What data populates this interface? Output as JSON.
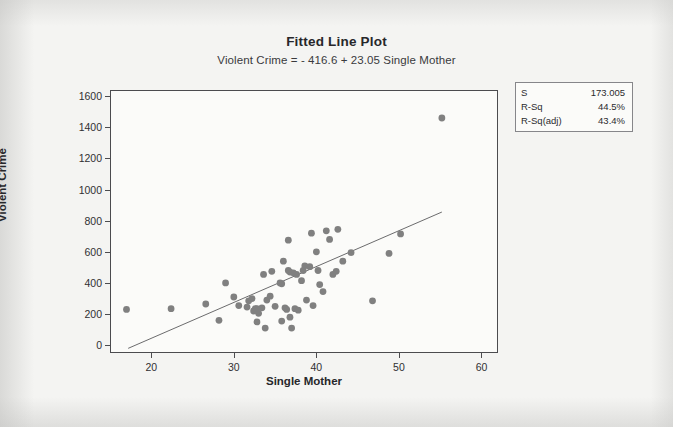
{
  "figure": {
    "background_color": "#f4f4f2",
    "plot_bg_color": "#fbfbf9",
    "axis_color": "#4c4c4f",
    "point_color": "#808080",
    "line_color": "#5a5a5c"
  },
  "stats_box": {
    "name": "regression-stats",
    "rows": [
      {
        "label": "S",
        "value": "173.005"
      },
      {
        "label": "R-Sq",
        "value": "44.5%"
      },
      {
        "label": "R-Sq(adj)",
        "value": "43.4%"
      }
    ]
  },
  "chart_data": {
    "type": "scatter",
    "title": "Fitted Line Plot",
    "subtitle": "Violent Crime =  - 416.6 + 23.05 Single Mother",
    "xlabel": "Single Mother",
    "ylabel": "Violent Crime",
    "xlim": [
      15.0,
      62.0
    ],
    "ylim": [
      -50,
      1640
    ],
    "xticks": [
      20,
      30,
      40,
      50,
      60
    ],
    "yticks": [
      0,
      200,
      400,
      600,
      800,
      1000,
      1200,
      1400,
      1600
    ],
    "grid": false,
    "legend": null,
    "regression": {
      "intercept": -416.6,
      "slope": 23.05,
      "equation": "Violent Crime =  - 416.6 + 23.05 Single Mother",
      "s": 173.005,
      "r_sq": 44.5,
      "r_sq_adj": 43.4,
      "x_start": 17.2,
      "x_end": 55.2
    },
    "series": [
      {
        "name": "Violent Crime vs Single Mother",
        "marker": "filled-circle",
        "points": [
          [
            17.0,
            230
          ],
          [
            22.4,
            235
          ],
          [
            26.6,
            265
          ],
          [
            28.2,
            160
          ],
          [
            29.0,
            400
          ],
          [
            30.0,
            310
          ],
          [
            30.6,
            255
          ],
          [
            31.6,
            245
          ],
          [
            31.8,
            285
          ],
          [
            32.2,
            300
          ],
          [
            32.4,
            220
          ],
          [
            32.6,
            235
          ],
          [
            32.8,
            235
          ],
          [
            32.8,
            150
          ],
          [
            33.0,
            205
          ],
          [
            33.4,
            240
          ],
          [
            33.6,
            455
          ],
          [
            33.8,
            110
          ],
          [
            34.0,
            290
          ],
          [
            34.4,
            315
          ],
          [
            34.6,
            475
          ],
          [
            35.0,
            250
          ],
          [
            35.6,
            400
          ],
          [
            35.8,
            395
          ],
          [
            35.8,
            155
          ],
          [
            36.0,
            540
          ],
          [
            36.2,
            240
          ],
          [
            36.4,
            230
          ],
          [
            36.6,
            675
          ],
          [
            36.6,
            480
          ],
          [
            36.8,
            180
          ],
          [
            36.8,
            470
          ],
          [
            37.0,
            110
          ],
          [
            37.2,
            465
          ],
          [
            37.4,
            235
          ],
          [
            37.6,
            455
          ],
          [
            37.8,
            225
          ],
          [
            38.2,
            415
          ],
          [
            38.4,
            480
          ],
          [
            38.6,
            510
          ],
          [
            38.8,
            290
          ],
          [
            39.2,
            505
          ],
          [
            39.4,
            720
          ],
          [
            39.6,
            255
          ],
          [
            40.0,
            600
          ],
          [
            40.2,
            480
          ],
          [
            40.4,
            390
          ],
          [
            40.8,
            345
          ],
          [
            41.2,
            735
          ],
          [
            41.6,
            680
          ],
          [
            42.0,
            455
          ],
          [
            42.4,
            475
          ],
          [
            42.6,
            745
          ],
          [
            43.2,
            540
          ],
          [
            44.2,
            595
          ],
          [
            46.8,
            285
          ],
          [
            48.8,
            590
          ],
          [
            50.2,
            715
          ],
          [
            55.2,
            1460
          ]
        ]
      }
    ]
  }
}
